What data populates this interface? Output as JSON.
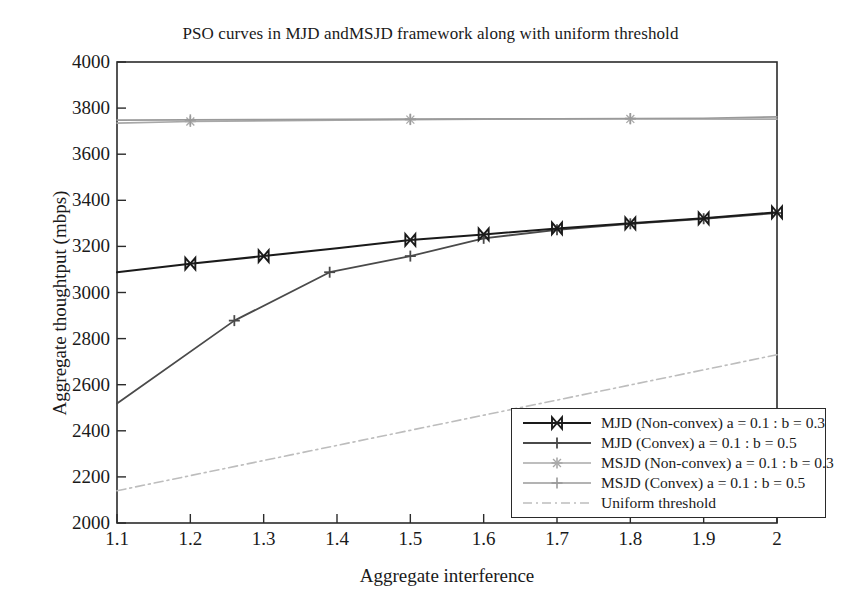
{
  "chart_data": {
    "type": "line",
    "title": "PSO curves in MJD andMSJD framework along with uniform threshold",
    "xlabel": "Aggregate interference",
    "ylabel": "Aggregate thoughtput (mbps)",
    "xlim": [
      1.1,
      2.0
    ],
    "ylim": [
      2000,
      4000
    ],
    "xticks": [
      "1.1",
      "1.2",
      "1.3",
      "1.4",
      "1.5",
      "1.6",
      "1.7",
      "1.8",
      "1.9",
      "2"
    ],
    "xtick_values": [
      1.1,
      1.2,
      1.3,
      1.4,
      1.5,
      1.6,
      1.7,
      1.8,
      1.9,
      2.0
    ],
    "yticks": [
      "4000",
      "3800",
      "3600",
      "3400",
      "3200",
      "3000",
      "2800",
      "2600",
      "2400",
      "2200",
      "2000"
    ],
    "ytick_values": [
      4000,
      3800,
      3600,
      3400,
      3200,
      3000,
      2800,
      2600,
      2400,
      2200,
      2000
    ],
    "grid": false,
    "legend_position": "lower right",
    "series": [
      {
        "name": "MJD (Non-convex) a = 0.1 : b = 0.3",
        "color": "#1a1a1a",
        "width": 2.0,
        "dash": "none",
        "marker": "bowtie",
        "x": [
          1.1,
          1.2,
          1.3,
          1.4,
          1.5,
          1.6,
          1.7,
          1.8,
          1.9,
          2.0
        ],
        "y": [
          3088,
          3125,
          3158,
          3192,
          3228,
          3252,
          3278,
          3300,
          3322,
          3348
        ],
        "marker_x": [
          1.2,
          1.3,
          1.5,
          1.6,
          1.7,
          1.8,
          1.9,
          2.0
        ],
        "marker_y": [
          3125,
          3158,
          3228,
          3252,
          3278,
          3300,
          3322,
          3348
        ]
      },
      {
        "name": "MJD (Convex) a = 0.1 : b = 0.5",
        "color": "#4a4a4a",
        "width": 1.8,
        "dash": "none",
        "marker": "plus",
        "x": [
          1.1,
          1.26,
          1.39,
          1.5,
          1.6,
          1.7,
          1.8,
          1.9,
          2.0
        ],
        "y": [
          2518,
          2878,
          3088,
          3158,
          3235,
          3272,
          3298,
          3320,
          3345
        ],
        "marker_x": [
          1.26,
          1.39,
          1.5,
          1.6,
          1.7,
          1.8,
          1.9,
          2.0
        ],
        "marker_y": [
          2878,
          3088,
          3158,
          3235,
          3272,
          3298,
          3320,
          3345
        ]
      },
      {
        "name": "MSJD (Non-convex) a = 0.1 : b = 0.3",
        "color": "#a8a8a8",
        "width": 1.6,
        "dash": "none",
        "marker": "asterisk",
        "x": [
          1.1,
          1.2,
          1.4,
          1.6,
          1.8,
          2.0
        ],
        "y": [
          3735,
          3742,
          3748,
          3752,
          3753,
          3752
        ],
        "marker_x": [
          1.2,
          1.5,
          1.8
        ],
        "marker_y": [
          3742,
          3750,
          3753
        ]
      },
      {
        "name": "MSJD (Convex) a = 0.1 : b = 0.5",
        "color": "#9a9a9a",
        "width": 1.6,
        "dash": "none",
        "marker": "plus",
        "x": [
          1.1,
          1.3,
          1.5,
          1.7,
          1.9,
          2.0
        ],
        "y": [
          3748,
          3750,
          3752,
          3754,
          3756,
          3762
        ],
        "marker_x": [
          1.2,
          1.5,
          1.8
        ],
        "marker_y": [
          3749,
          3752,
          3755
        ]
      },
      {
        "name": "Uniform threshold",
        "color": "#bdbdbd",
        "width": 1.6,
        "dash": "dashdot",
        "marker": "none",
        "x": [
          1.1,
          2.0
        ],
        "y": [
          2140,
          2730
        ],
        "marker_x": [],
        "marker_y": []
      }
    ]
  }
}
